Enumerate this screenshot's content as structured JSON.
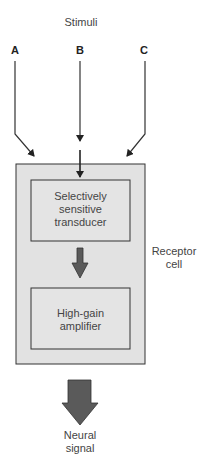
{
  "title": "Stimuli",
  "stimuli": [
    {
      "label": "A"
    },
    {
      "label": "B"
    },
    {
      "label": "C"
    }
  ],
  "receptor": {
    "label_line1": "Receptor",
    "label_line2": "cell",
    "transducer": {
      "line1": "Selectively",
      "line2": "sensitive",
      "line3": "transducer"
    },
    "amplifier": {
      "line1": "High-gain",
      "line2": "amplifier"
    }
  },
  "output": {
    "line1": "Neural",
    "line2": "signal"
  },
  "colors": {
    "cell_fill": "#e2e2e2",
    "box_fill": "#e4e4e4",
    "stroke": "#333333",
    "arrow_fill": "#5a5a5a"
  }
}
